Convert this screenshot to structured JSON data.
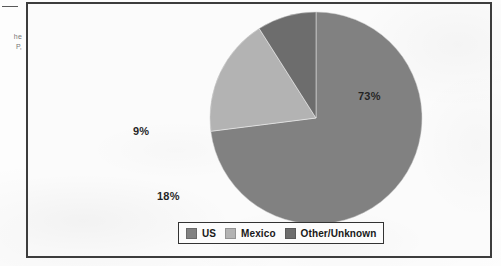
{
  "page": {
    "margin_note_line1": "he",
    "margin_note_line2": "P,"
  },
  "colors": {
    "us": "#7f7f7f",
    "mexico": "#b2b2b2",
    "other": "#6b6b6b",
    "frame_border": "#3a3a3a",
    "legend_border": "#2f2f2f",
    "label_text": "#1f1f1f",
    "paper": "#fbfbfb"
  },
  "chart_data": {
    "type": "pie",
    "title": "",
    "categories": [
      "US",
      "Mexico",
      "Other/Unknown"
    ],
    "values": [
      73,
      18,
      9
    ],
    "value_labels": [
      "73%",
      "18%",
      "9%"
    ],
    "unit": "%",
    "start_angle_deg": 0,
    "direction": "clockwise",
    "legend_position": "bottom",
    "grid": false,
    "slice_colors": [
      "#7f7f7f",
      "#b2b2b2",
      "#6b6b6b"
    ]
  },
  "labels": {
    "us_pct": "73%",
    "mexico_pct": "18%",
    "other_pct": "9%"
  },
  "legend": {
    "items": [
      {
        "label": "US",
        "color": "#7f7f7f"
      },
      {
        "label": "Mexico",
        "color": "#b2b2b2"
      },
      {
        "label": "Other/Unknown",
        "color": "#6b6b6b"
      }
    ]
  }
}
